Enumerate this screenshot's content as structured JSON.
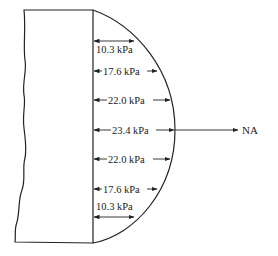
{
  "figure": {
    "type": "bending stress distribution",
    "neutral_axis_label": "NA",
    "stress_unit": "kPa",
    "stress_levels": [
      {
        "label": "10.3 kPa",
        "value": 10.3,
        "y": 41
      },
      {
        "label": "17.6 kPa",
        "value": 17.6,
        "y": 71
      },
      {
        "label": "22.0 kPa",
        "value": 22.0,
        "y": 100
      },
      {
        "label": "23.4 kPa",
        "value": 23.4,
        "y": 130
      },
      {
        "label": "22.0 kPa",
        "value": 22.0,
        "y": 159
      },
      {
        "label": "17.6 kPa",
        "value": 17.6,
        "y": 189
      },
      {
        "label": "10.3 kPa",
        "value": 10.3,
        "y": 219
      }
    ],
    "colors": {
      "line": "#222222",
      "background": "#ffffff"
    }
  }
}
